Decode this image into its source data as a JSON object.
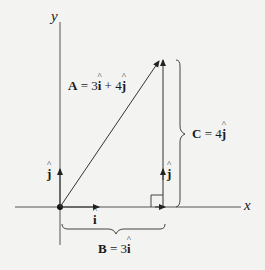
{
  "diagram": {
    "title": "",
    "axes": {
      "x_label": "x",
      "y_label": "y"
    },
    "vectors": {
      "A": {
        "name": "A",
        "equals": "=",
        "expr_coef1": "3",
        "expr_unit1": "i",
        "plus": "+",
        "expr_coef2": "4",
        "expr_unit2": "j",
        "description": "A = 3î + 4ĵ"
      },
      "B": {
        "name": "B",
        "equals": "=",
        "coef": "3",
        "unit": "i",
        "description": "B = 3î"
      },
      "C": {
        "name": "C",
        "equals": "=",
        "coef": "4",
        "unit": "j",
        "description": "C = 4ĵ"
      }
    },
    "unit_vectors": {
      "i_label": "i",
      "j_label_origin": "j",
      "j_label_right": "j"
    },
    "colors": {
      "background": "#f3f3f2",
      "line": "#444444",
      "text": "#1a1a1a"
    }
  }
}
